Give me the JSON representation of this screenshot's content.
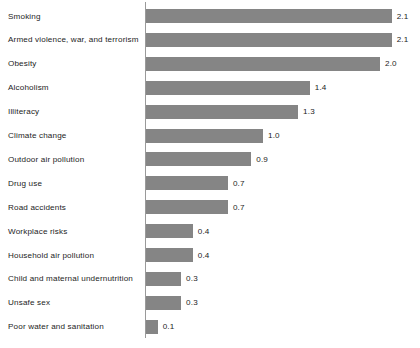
{
  "chart_data": {
    "type": "bar",
    "orientation": "horizontal",
    "title": "",
    "subtitle": "",
    "xlabel": "",
    "ylabel": "",
    "grid": false,
    "legend": null,
    "xlim": [
      0,
      2.2
    ],
    "axis": {
      "value_axis_visible": false,
      "category_axis_visible": true,
      "category_axis_color": "#9a9a9a"
    },
    "value_label_format": "0.0",
    "bar_color": "#858585",
    "categories": [
      "Smoking",
      "Armed violence, war, and terrorism",
      "Obesity",
      "Alcoholism",
      "Illiteracy",
      "Climate change",
      "Outdoor air pollution",
      "Drug use",
      "Road accidents",
      "Workplace risks",
      "Household air pollution",
      "Child and maternal undernutrition",
      "Unsafe sex",
      "Poor water and sanitation"
    ],
    "values": [
      2.1,
      2.1,
      2.0,
      1.4,
      1.3,
      1.0,
      0.9,
      0.7,
      0.7,
      0.4,
      0.4,
      0.3,
      0.3,
      0.1
    ],
    "value_labels": [
      "2.1",
      "2.1",
      "2.0",
      "1.4",
      "1.3",
      "1.0",
      "0.9",
      "0.7",
      "0.7",
      "0.4",
      "0.4",
      "0.3",
      "0.3",
      "0.1"
    ]
  }
}
